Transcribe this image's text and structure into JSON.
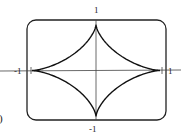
{
  "chart_data": {
    "type": "line",
    "title": "",
    "curve": "astroid",
    "equation": "x^(2/3) + y^(2/3) = 1",
    "parametric": {
      "x": "cos^3(t)",
      "y": "sin^3(t)",
      "t_range": [
        0,
        6.2832
      ]
    },
    "xlim": [
      -1,
      1
    ],
    "ylim": [
      -1,
      1
    ],
    "xlabel": "",
    "ylabel": "",
    "tick_labels": {
      "x_left": "-1",
      "x_right": "1",
      "y_top": "1",
      "y_bottom": "-1"
    },
    "grid": false,
    "frame": "rounded-rectangle",
    "series": [
      {
        "name": "astroid",
        "color": "#111111"
      }
    ],
    "cusps": [
      {
        "x": 1,
        "y": 0
      },
      {
        "x": 0,
        "y": 1
      },
      {
        "x": -1,
        "y": 0
      },
      {
        "x": 0,
        "y": -1
      }
    ]
  },
  "panel_label_fragment": ")",
  "colors": {
    "curve": "#111111",
    "axes": "#333333",
    "frame": "#222222"
  }
}
